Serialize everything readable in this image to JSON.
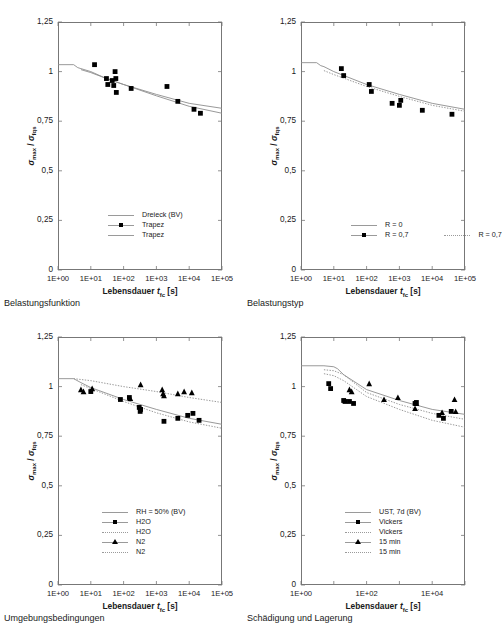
{
  "figure": {
    "axis_label_y": "σmax / σfqs",
    "axis_label_x": "Lebensdauer tfc [s]",
    "y_ticks": [
      "0",
      "0,25",
      "0,5",
      "0,75",
      "1",
      "1,25"
    ],
    "x_ticks_full": [
      "1E+00",
      "1E+01",
      "1E+02",
      "1E+03",
      "1E+04",
      "1E+05"
    ],
    "x_ticks_sparse": [
      "1E+00",
      "1E+02",
      "1E+04"
    ],
    "colors": {
      "marker": "#000000",
      "curve": "#8d8d8d",
      "axis": "#777777",
      "text": "#1a1a1a"
    }
  },
  "panels": [
    {
      "id": "belastungsfunktion",
      "caption": "Belastungsfunktion",
      "legend_layout": "single-column",
      "legend": [
        {
          "label": "Dreieck (BV)",
          "key": "line"
        },
        {
          "label": "Trapez",
          "key": "square"
        },
        {
          "label": "Trapez",
          "key": "line"
        }
      ]
    },
    {
      "id": "belastungstyp",
      "caption": "Belastungstyp",
      "legend_layout": "two-column",
      "legend": [
        {
          "label": "R = 0",
          "key": "line"
        },
        {
          "label": "R = 0,7",
          "key": "square"
        },
        {
          "label": "R = 0,7",
          "key": "dotted"
        }
      ]
    },
    {
      "id": "umgebungsbedingungen",
      "caption": "Umgebungsbedingungen",
      "legend_layout": "single-column",
      "legend": [
        {
          "label": "RH = 50% (BV)",
          "key": "line"
        },
        {
          "label": "H2O",
          "key": "square"
        },
        {
          "label": "H2O",
          "key": "dotted"
        },
        {
          "label": "N2",
          "key": "triangle"
        },
        {
          "label": "N2",
          "key": "dotted"
        }
      ]
    },
    {
      "id": "schaedigung-und-lagerung",
      "caption": "Schädigung und Lagerung",
      "legend_layout": "single-column",
      "legend": [
        {
          "label": "UST, 7d (BV)",
          "key": "line"
        },
        {
          "label": "Vickers",
          "key": "square"
        },
        {
          "label": "Vickers",
          "key": "dotted"
        },
        {
          "label": "15 min",
          "key": "triangle"
        },
        {
          "label": "15 min",
          "key": "dotted"
        }
      ]
    }
  ],
  "chart_data": [
    {
      "type": "scatter",
      "panel": "Belastungsfunktion",
      "title": "Belastungsfunktion",
      "xlabel": "Lebensdauer tfc [s]",
      "ylabel": "σmax / σfqs",
      "xscale": "log",
      "xlim": [
        1,
        100000
      ],
      "ylim": [
        0,
        1.25
      ],
      "ytick_values": [
        0,
        0.25,
        0.5,
        0.75,
        1,
        1.25
      ],
      "xtick_values": [
        1,
        10,
        100,
        1000,
        10000,
        100000
      ],
      "grid": false,
      "legend_position": "lower-center",
      "series": [
        {
          "name": "Dreieck (BV)",
          "style": "line",
          "x": [
            1,
            3,
            4,
            5,
            10,
            30,
            100,
            1000,
            10000,
            100000
          ],
          "y": [
            1.035,
            1.035,
            1.02,
            1.015,
            1.0,
            0.965,
            0.935,
            0.885,
            0.84,
            0.815
          ]
        },
        {
          "name": "Trapez",
          "style": "marker-square",
          "x": [
            13,
            30,
            33,
            45,
            50,
            55,
            58,
            60,
            170,
            2100,
            4500,
            14000,
            22000
          ],
          "y": [
            1.035,
            0.965,
            0.935,
            0.955,
            0.93,
            1.0,
            0.965,
            0.895,
            0.915,
            0.925,
            0.85,
            0.81,
            0.79
          ]
        },
        {
          "name": "Trapez",
          "style": "line",
          "x": [
            5,
            10,
            30,
            100,
            1000,
            10000,
            100000
          ],
          "y": [
            1.01,
            0.995,
            0.965,
            0.935,
            0.878,
            0.825,
            0.79
          ]
        }
      ]
    },
    {
      "type": "scatter",
      "panel": "Belastungstyp",
      "title": "Belastungstyp",
      "xlabel": "Lebensdauer tfc [s]",
      "ylabel": "σmax / σfqs",
      "xscale": "log",
      "xlim": [
        1,
        100000
      ],
      "ylim": [
        0,
        1.25
      ],
      "ytick_values": [
        0,
        0.25,
        0.5,
        0.75,
        1,
        1.25
      ],
      "xtick_values": [
        1,
        10,
        100,
        1000,
        10000,
        100000
      ],
      "grid": false,
      "legend_position": "lower-center",
      "series": [
        {
          "name": "R = 0",
          "style": "line",
          "x": [
            1,
            3,
            4,
            5,
            10,
            100,
            1000,
            10000,
            100000
          ],
          "y": [
            1.045,
            1.045,
            1.03,
            1.025,
            1.0,
            0.935,
            0.885,
            0.84,
            0.81
          ]
        },
        {
          "name": "R = 0,7",
          "style": "marker-square",
          "x": [
            17,
            20,
            120,
            140,
            600,
            1000,
            1100,
            5000,
            40000
          ],
          "y": [
            1.015,
            0.98,
            0.935,
            0.9,
            0.84,
            0.83,
            0.855,
            0.805,
            0.785
          ]
        },
        {
          "name": "R = 0,7",
          "style": "dotted",
          "x": [
            5,
            10,
            100,
            1000,
            10000,
            100000
          ],
          "y": [
            1.005,
            0.985,
            0.925,
            0.875,
            0.83,
            0.8
          ]
        }
      ]
    },
    {
      "type": "scatter",
      "panel": "Umgebungsbedingungen",
      "title": "Umgebungsbedingungen",
      "xlabel": "Lebensdauer tfc [s]",
      "ylabel": "σmax / σfqs",
      "xscale": "log",
      "xlim": [
        1,
        100000
      ],
      "ylim": [
        0,
        1.25
      ],
      "ytick_values": [
        0,
        0.25,
        0.5,
        0.75,
        1,
        1.25
      ],
      "xtick_values": [
        1,
        10,
        100,
        1000,
        10000,
        100000
      ],
      "grid": false,
      "legend_position": "lower-center",
      "series": [
        {
          "name": "RH = 50% (BV)",
          "style": "line",
          "x": [
            1,
            3,
            5,
            10,
            100,
            1000,
            10000,
            100000
          ],
          "y": [
            1.04,
            1.04,
            1.02,
            0.995,
            0.935,
            0.885,
            0.84,
            0.81
          ]
        },
        {
          "name": "H2O",
          "style": "marker-square",
          "x": [
            10,
            80,
            150,
            300,
            320,
            330,
            1700,
            4500,
            9000,
            13000,
            20000
          ],
          "y": [
            0.975,
            0.935,
            0.945,
            0.895,
            0.875,
            0.885,
            0.825,
            0.84,
            0.855,
            0.865,
            0.83
          ]
        },
        {
          "name": "H2O",
          "style": "dotted",
          "x": [
            5,
            10,
            100,
            1000,
            10000,
            100000
          ],
          "y": [
            1.01,
            0.99,
            0.925,
            0.868,
            0.822,
            0.79
          ]
        },
        {
          "name": "N2",
          "style": "marker-triangle",
          "x": [
            5,
            6,
            11,
            160,
            330,
            1500,
            1600,
            1700,
            4500,
            7000,
            12000
          ],
          "y": [
            0.985,
            0.975,
            0.99,
            0.94,
            1.01,
            0.985,
            0.965,
            0.955,
            0.965,
            0.975,
            0.97
          ]
        },
        {
          "name": "N2",
          "style": "dotted",
          "x": [
            3,
            10,
            100,
            1000,
            10000,
            100000
          ],
          "y": [
            1.04,
            1.03,
            1.0,
            0.975,
            0.945,
            0.92
          ]
        }
      ]
    },
    {
      "type": "scatter",
      "panel": "Schädigung und Lagerung",
      "title": "Schädigung und Lagerung",
      "xlabel": "Lebensdauer tfc [s]",
      "ylabel": "σmax / σfqs",
      "xscale": "log",
      "xlim": [
        1,
        100000
      ],
      "ylim": [
        0,
        1.25
      ],
      "ytick_values": [
        0,
        0.25,
        0.5,
        0.75,
        1,
        1.25
      ],
      "xtick_values": [
        1,
        100,
        10000
      ],
      "grid": false,
      "legend_position": "lower-center",
      "series": [
        {
          "name": "UST, 7d (BV)",
          "style": "line",
          "x": [
            1,
            5,
            10,
            13,
            20,
            100,
            1000,
            10000,
            100000
          ],
          "y": [
            1.105,
            1.105,
            1.1,
            1.09,
            1.06,
            0.985,
            0.93,
            0.885,
            0.86
          ]
        },
        {
          "name": "Vickers",
          "style": "marker-square",
          "x": [
            7,
            8,
            20,
            22,
            30,
            40,
            3000,
            3300,
            16000,
            22000,
            38000
          ],
          "y": [
            1.015,
            0.99,
            0.93,
            0.925,
            0.925,
            0.915,
            0.915,
            0.92,
            0.855,
            0.84,
            0.875
          ]
        },
        {
          "name": "Vickers",
          "style": "dotted",
          "x": [
            5,
            10,
            20,
            100,
            1000,
            10000,
            100000
          ],
          "y": [
            1.065,
            1.055,
            1.03,
            0.95,
            0.885,
            0.83,
            0.795
          ]
        },
        {
          "name": "15 min",
          "style": "marker-triangle",
          "x": [
            30,
            35,
            120,
            340,
            900,
            3000,
            3300,
            20000,
            48000,
            52000
          ],
          "y": [
            0.985,
            0.975,
            1.015,
            0.935,
            0.945,
            0.89,
            0.915,
            0.87,
            0.935,
            0.875
          ]
        },
        {
          "name": "15 min",
          "style": "dotted",
          "x": [
            5,
            10,
            20,
            100,
            1000,
            10000,
            100000
          ],
          "y": [
            1.085,
            1.08,
            1.06,
            0.97,
            0.91,
            0.865,
            0.835
          ]
        }
      ]
    }
  ]
}
